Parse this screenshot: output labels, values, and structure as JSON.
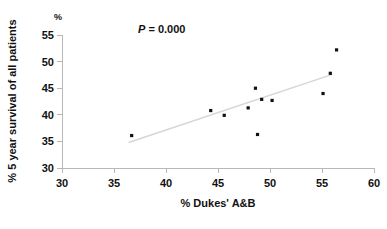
{
  "chart_data": {
    "type": "scatter",
    "title": "",
    "xlabel": "% Dukes' A&B",
    "ylabel": "% 5 year survival of all patients",
    "yunit": "%",
    "xlim": [
      30,
      60
    ],
    "ylim": [
      30,
      55
    ],
    "xticks": [
      30,
      35,
      40,
      45,
      50,
      55,
      60
    ],
    "yticks": [
      30,
      35,
      40,
      45,
      50,
      55
    ],
    "xtick_labels": [
      "30",
      "35",
      "40",
      "45",
      "50",
      "55",
      "60"
    ],
    "ytick_labels": [
      "30",
      "35",
      "40",
      "45",
      "50",
      "55"
    ],
    "grid": false,
    "legend": false,
    "annotations": [
      {
        "name": "p-value",
        "prefix": "P",
        "text": " = 0.000",
        "full_text": "P = 0.000",
        "x": 40.2,
        "y": 53.6
      }
    ],
    "series": [
      {
        "name": "hospitals",
        "marker": "square",
        "color": "#111111",
        "points": [
          {
            "x": 36.7,
            "y": 36.1
          },
          {
            "x": 44.3,
            "y": 40.8
          },
          {
            "x": 45.6,
            "y": 39.9
          },
          {
            "x": 47.9,
            "y": 41.3
          },
          {
            "x": 48.6,
            "y": 45.0
          },
          {
            "x": 48.8,
            "y": 36.3
          },
          {
            "x": 49.2,
            "y": 42.9
          },
          {
            "x": 50.2,
            "y": 42.7
          },
          {
            "x": 55.1,
            "y": 44.0
          },
          {
            "x": 55.8,
            "y": 47.8
          },
          {
            "x": 56.4,
            "y": 52.2
          }
        ]
      }
    ],
    "trend_line": {
      "name": "linear-fit",
      "color": "#d6d6d6",
      "x_start": 36.4,
      "y_start": 34.8,
      "x_end": 56.0,
      "y_end": 47.6
    }
  }
}
